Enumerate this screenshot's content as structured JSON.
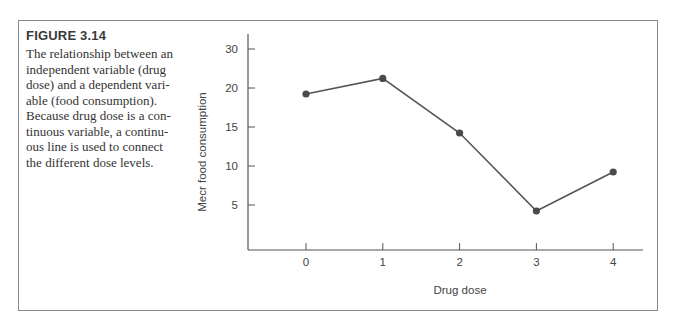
{
  "figure": {
    "label": "FIGURE 3.14",
    "caption_lines": [
      "The relationship between an",
      "independent variable (drug",
      "dose) and a dependent vari-",
      "able (food consumption).",
      "Because drug dose is a con-",
      "tinuous variable, a continu-",
      "ous line is used to connect",
      "the different dose levels."
    ]
  },
  "colors": {
    "line": "#555555",
    "marker": "#4a4a4a",
    "axis": "#555555",
    "border": "#8a8a8a"
  },
  "chart_data": {
    "type": "line",
    "title": "",
    "xlabel": "Drug dose",
    "ylabel": "Mecr food consumption",
    "x": [
      0,
      1,
      2,
      3,
      4
    ],
    "categories": [
      "0",
      "1",
      "2",
      "3",
      "4"
    ],
    "values": [
      20,
      22,
      15,
      5,
      10
    ],
    "series": [
      {
        "name": "Mean food consumption",
        "values": [
          20,
          22,
          15,
          5,
          10
        ]
      }
    ],
    "y_tick_labels": [
      "5",
      "10",
      "15",
      "20",
      "30"
    ],
    "x_tick_labels": [
      "0",
      "1",
      "2",
      "3",
      "4"
    ],
    "ylim": [
      0,
      30
    ],
    "grid": false,
    "legend": "none",
    "markers": true,
    "note": "Y axis has a break: tick labeled 30 appears one step above 20 (25 omitted)."
  }
}
